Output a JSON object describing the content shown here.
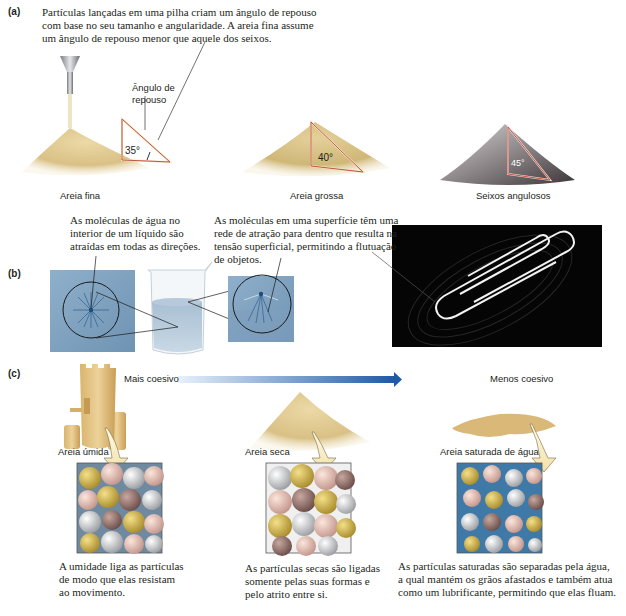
{
  "panel_a": {
    "label": "(a)",
    "caption": "Partículas lançadas em uma pilha criam um ângulo de repouso com base no seu tamanho e angularidade. A areia fina assume um ângulo de repouso menor que aquele dos seixos.",
    "caption_lines": [
      "Partículas lançadas em uma pilha criam um ângulo de repouso",
      "com base no seu tamanho e angularidade. A areia fina assume",
      "um ângulo de repouso menor que aquele dos seixos."
    ],
    "angle_label_lines": [
      "Ângulo de",
      "repouso"
    ],
    "piles": [
      {
        "name": "Areia fina",
        "angle": "35°",
        "color": "#dcc48a"
      },
      {
        "name": "Areia grossa",
        "angle": "40°",
        "color": "#d2bc82"
      },
      {
        "name": "Seixos angulosos",
        "angle": "45°",
        "color": "#8a8588"
      }
    ]
  },
  "panel_b": {
    "label": "(b)",
    "interior_caption_lines": [
      "As moléculas de água no",
      "interior de um líquido são",
      "atraídas em todas as direções."
    ],
    "surface_caption_lines": [
      "As moléculas em uma superfície têm uma",
      "rede de atração para dentro que resulta na",
      "tensão superficial, permitindo a flutuação",
      "de objetos."
    ]
  },
  "panel_c": {
    "label": "(c)",
    "scale_left": "Mais coesivo",
    "scale_right": "Menos coesivo",
    "arrow_color_start": "#e3eefa",
    "arrow_color_end": "#1e5aa8",
    "states": [
      {
        "name": "Areia úmida",
        "description_lines": [
          "A umidade liga as partículas",
          "de modo que elas resistam",
          "ao movimento."
        ]
      },
      {
        "name": "Areia seca",
        "description_lines": [
          "As partículas secas são ligadas",
          "somente pelas suas formas e",
          "pelo atrito entre si."
        ]
      },
      {
        "name": "Areia saturada de água",
        "description_lines": [
          "As partículas saturadas são separadas pela água,",
          "a qual mantém os grãos afastados e também atua",
          "como um lubrificante, permitindo que elas fluam."
        ]
      }
    ]
  }
}
